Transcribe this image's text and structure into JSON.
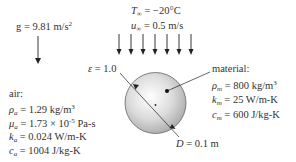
{
  "gravity": {
    "label": "g = 9.81 m/s",
    "exp": "2"
  },
  "freestream": {
    "T_sym": "T",
    "T_sub": "∞",
    "T_val": " = −20°C",
    "u_sym": "u",
    "u_sub": "∞",
    "u_val": " = 0.5 m/s",
    "arrow_count": 7
  },
  "emissivity": {
    "sym": "ε",
    "val": " = 1.0"
  },
  "diameter": {
    "sym": "D",
    "val": " = 0.1 m"
  },
  "air": {
    "title": "air:",
    "rho": {
      "sym": "ρ",
      "sub": "a",
      "val": " = 1.29 kg/m",
      "exp": "3"
    },
    "mu": {
      "sym": "μ",
      "sub": "a",
      "val": " = 1.73 × 10",
      "exp": "-5",
      "unit": " Pa-s"
    },
    "k": {
      "sym": "k",
      "sub": "a",
      "val": " = 0.024 W/m-K"
    },
    "c": {
      "sym": "c",
      "sub": "a",
      "val": " = 1004 J/kg-K"
    }
  },
  "material": {
    "title": "material:",
    "rho": {
      "sym": "ρ",
      "sub": "m",
      "val": " = 800 kg/m",
      "exp": "3"
    },
    "k": {
      "sym": "k",
      "sub": "m",
      "val": " = 25 W/m-K"
    },
    "c": {
      "sym": "c",
      "sub": "m",
      "val": " = 600 J/kg-K"
    }
  },
  "colors": {
    "sphere_fill": "#d8d8d8",
    "sphere_stroke": "#555555",
    "line": "#222222"
  }
}
